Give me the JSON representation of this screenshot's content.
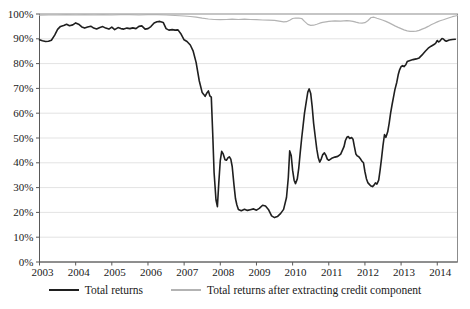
{
  "chart_data": {
    "type": "line",
    "title": "",
    "xlabel": "",
    "ylabel": "",
    "grid": "horizontal",
    "legend_position": "bottom",
    "x_axis": {
      "min": 2003,
      "max": 2014.56,
      "tick_labels": [
        "2003",
        "2004",
        "2005",
        "2006",
        "2007",
        "2008",
        "2009",
        "2010",
        "2011",
        "2012",
        "2013",
        "2014"
      ]
    },
    "y_axis": {
      "min": 0,
      "max": 100,
      "step": 10,
      "unit": "%",
      "tick_labels": [
        "0%",
        "10%",
        "20%",
        "30%",
        "40%",
        "50%",
        "60%",
        "70%",
        "80%",
        "90%",
        "100%"
      ]
    },
    "series": [
      {
        "name": "Total returns",
        "color": "#1f1f1f",
        "stroke_width": 1.6,
        "points": [
          [
            2003.0,
            89.6
          ],
          [
            2003.08,
            89.2
          ],
          [
            2003.17,
            88.9
          ],
          [
            2003.25,
            89.0
          ],
          [
            2003.33,
            89.4
          ],
          [
            2003.42,
            91.5
          ],
          [
            2003.5,
            93.8
          ],
          [
            2003.58,
            95.0
          ],
          [
            2003.67,
            95.4
          ],
          [
            2003.75,
            95.9
          ],
          [
            2003.83,
            95.3
          ],
          [
            2003.92,
            95.6
          ],
          [
            2004.0,
            96.4
          ],
          [
            2004.08,
            95.9
          ],
          [
            2004.17,
            94.8
          ],
          [
            2004.25,
            94.3
          ],
          [
            2004.33,
            94.7
          ],
          [
            2004.42,
            95.1
          ],
          [
            2004.5,
            94.3
          ],
          [
            2004.58,
            94.0
          ],
          [
            2004.67,
            94.6
          ],
          [
            2004.75,
            94.9
          ],
          [
            2004.83,
            94.3
          ],
          [
            2004.92,
            93.9
          ],
          [
            2005.0,
            94.7
          ],
          [
            2005.08,
            93.7
          ],
          [
            2005.17,
            94.5
          ],
          [
            2005.25,
            94.1
          ],
          [
            2005.33,
            93.9
          ],
          [
            2005.42,
            94.3
          ],
          [
            2005.5,
            94.1
          ],
          [
            2005.58,
            94.4
          ],
          [
            2005.67,
            94.1
          ],
          [
            2005.75,
            95.0
          ],
          [
            2005.83,
            95.2
          ],
          [
            2005.92,
            93.9
          ],
          [
            2006.0,
            94.1
          ],
          [
            2006.08,
            94.9
          ],
          [
            2006.17,
            96.4
          ],
          [
            2006.25,
            96.9
          ],
          [
            2006.33,
            97.0
          ],
          [
            2006.42,
            96.6
          ],
          [
            2006.5,
            94.1
          ],
          [
            2006.58,
            93.5
          ],
          [
            2006.67,
            93.7
          ],
          [
            2006.75,
            93.5
          ],
          [
            2006.83,
            93.6
          ],
          [
            2006.92,
            91.8
          ],
          [
            2007.0,
            89.6
          ],
          [
            2007.08,
            88.9
          ],
          [
            2007.17,
            87.5
          ],
          [
            2007.25,
            85.0
          ],
          [
            2007.33,
            80.5
          ],
          [
            2007.42,
            73.0
          ],
          [
            2007.5,
            68.3
          ],
          [
            2007.54,
            67.6
          ],
          [
            2007.58,
            66.8
          ],
          [
            2007.63,
            68.2
          ],
          [
            2007.67,
            69.0
          ],
          [
            2007.71,
            67.0
          ],
          [
            2007.75,
            66.5
          ],
          [
            2007.79,
            52.0
          ],
          [
            2007.83,
            36.0
          ],
          [
            2007.88,
            25.0
          ],
          [
            2007.92,
            22.3
          ],
          [
            2007.96,
            32.0
          ],
          [
            2008.0,
            41.0
          ],
          [
            2008.04,
            44.6
          ],
          [
            2008.08,
            43.6
          ],
          [
            2008.13,
            41.2
          ],
          [
            2008.17,
            41.0
          ],
          [
            2008.21,
            42.0
          ],
          [
            2008.25,
            42.4
          ],
          [
            2008.29,
            41.5
          ],
          [
            2008.33,
            38.5
          ],
          [
            2008.38,
            31.0
          ],
          [
            2008.42,
            25.5
          ],
          [
            2008.46,
            23.0
          ],
          [
            2008.5,
            21.2
          ],
          [
            2008.58,
            20.7
          ],
          [
            2008.67,
            21.3
          ],
          [
            2008.75,
            20.8
          ],
          [
            2008.83,
            21.1
          ],
          [
            2008.92,
            21.4
          ],
          [
            2009.0,
            20.9
          ],
          [
            2009.08,
            21.6
          ],
          [
            2009.17,
            22.9
          ],
          [
            2009.25,
            22.6
          ],
          [
            2009.33,
            21.2
          ],
          [
            2009.42,
            18.6
          ],
          [
            2009.5,
            17.9
          ],
          [
            2009.58,
            18.3
          ],
          [
            2009.67,
            19.6
          ],
          [
            2009.75,
            21.2
          ],
          [
            2009.83,
            26.0
          ],
          [
            2009.88,
            34.0
          ],
          [
            2009.92,
            44.8
          ],
          [
            2009.96,
            43.0
          ],
          [
            2010.0,
            37.0
          ],
          [
            2010.04,
            33.0
          ],
          [
            2010.08,
            31.6
          ],
          [
            2010.13,
            33.5
          ],
          [
            2010.17,
            38.0
          ],
          [
            2010.21,
            44.0
          ],
          [
            2010.25,
            50.0
          ],
          [
            2010.29,
            55.0
          ],
          [
            2010.33,
            60.0
          ],
          [
            2010.38,
            65.0
          ],
          [
            2010.42,
            68.5
          ],
          [
            2010.46,
            69.8
          ],
          [
            2010.5,
            68.0
          ],
          [
            2010.54,
            63.0
          ],
          [
            2010.58,
            56.0
          ],
          [
            2010.63,
            50.0
          ],
          [
            2010.67,
            45.5
          ],
          [
            2010.71,
            42.0
          ],
          [
            2010.75,
            40.3
          ],
          [
            2010.79,
            41.5
          ],
          [
            2010.83,
            43.2
          ],
          [
            2010.88,
            44.0
          ],
          [
            2010.92,
            43.0
          ],
          [
            2010.96,
            41.5
          ],
          [
            2011.0,
            41.0
          ],
          [
            2011.08,
            41.8
          ],
          [
            2011.17,
            42.3
          ],
          [
            2011.25,
            42.6
          ],
          [
            2011.33,
            43.5
          ],
          [
            2011.42,
            46.5
          ],
          [
            2011.46,
            49.0
          ],
          [
            2011.5,
            50.3
          ],
          [
            2011.54,
            50.6
          ],
          [
            2011.58,
            49.8
          ],
          [
            2011.63,
            50.2
          ],
          [
            2011.67,
            49.5
          ],
          [
            2011.71,
            46.5
          ],
          [
            2011.75,
            43.5
          ],
          [
            2011.79,
            42.8
          ],
          [
            2011.83,
            42.4
          ],
          [
            2011.88,
            41.5
          ],
          [
            2011.92,
            40.6
          ],
          [
            2011.96,
            40.0
          ],
          [
            2012.0,
            36.5
          ],
          [
            2012.04,
            33.6
          ],
          [
            2012.08,
            32.0
          ],
          [
            2012.13,
            31.2
          ],
          [
            2012.17,
            30.6
          ],
          [
            2012.21,
            30.4
          ],
          [
            2012.25,
            31.0
          ],
          [
            2012.29,
            31.9
          ],
          [
            2012.33,
            31.4
          ],
          [
            2012.38,
            33.0
          ],
          [
            2012.42,
            37.0
          ],
          [
            2012.46,
            42.0
          ],
          [
            2012.5,
            47.0
          ],
          [
            2012.54,
            51.4
          ],
          [
            2012.58,
            50.3
          ],
          [
            2012.63,
            52.5
          ],
          [
            2012.67,
            56.0
          ],
          [
            2012.71,
            60.0
          ],
          [
            2012.75,
            63.5
          ],
          [
            2012.79,
            66.5
          ],
          [
            2012.83,
            69.5
          ],
          [
            2012.88,
            72.5
          ],
          [
            2012.92,
            75.5
          ],
          [
            2012.96,
            77.5
          ],
          [
            2013.0,
            78.8
          ],
          [
            2013.04,
            79.2
          ],
          [
            2013.08,
            78.8
          ],
          [
            2013.13,
            79.5
          ],
          [
            2013.17,
            80.8
          ],
          [
            2013.25,
            81.3
          ],
          [
            2013.33,
            81.6
          ],
          [
            2013.42,
            81.9
          ],
          [
            2013.5,
            82.3
          ],
          [
            2013.58,
            83.5
          ],
          [
            2013.67,
            85.0
          ],
          [
            2013.75,
            86.2
          ],
          [
            2013.83,
            87.0
          ],
          [
            2013.92,
            87.8
          ],
          [
            2013.96,
            88.3
          ],
          [
            2014.0,
            89.3
          ],
          [
            2014.04,
            88.7
          ],
          [
            2014.08,
            89.2
          ],
          [
            2014.13,
            90.1
          ],
          [
            2014.17,
            89.9
          ],
          [
            2014.21,
            89.3
          ],
          [
            2014.25,
            89.0
          ],
          [
            2014.33,
            89.5
          ],
          [
            2014.42,
            89.7
          ],
          [
            2014.5,
            89.8
          ]
        ]
      },
      {
        "name": "Total returns after extracting credit component",
        "color": "#b3b3b3",
        "stroke_width": 1.2,
        "points": [
          [
            2003.0,
            99.5
          ],
          [
            2003.25,
            99.6
          ],
          [
            2003.5,
            99.6
          ],
          [
            2003.75,
            99.7
          ],
          [
            2004.0,
            99.6
          ],
          [
            2004.25,
            99.7
          ],
          [
            2004.5,
            99.6
          ],
          [
            2004.75,
            99.7
          ],
          [
            2005.0,
            99.6
          ],
          [
            2005.25,
            99.7
          ],
          [
            2005.5,
            99.7
          ],
          [
            2005.75,
            99.6
          ],
          [
            2006.0,
            99.7
          ],
          [
            2006.25,
            99.7
          ],
          [
            2006.5,
            99.6
          ],
          [
            2006.75,
            99.4
          ],
          [
            2007.0,
            99.2
          ],
          [
            2007.17,
            99.0
          ],
          [
            2007.33,
            98.7
          ],
          [
            2007.5,
            98.3
          ],
          [
            2007.67,
            98.0
          ],
          [
            2007.83,
            97.8
          ],
          [
            2008.0,
            97.7
          ],
          [
            2008.17,
            97.8
          ],
          [
            2008.33,
            97.9
          ],
          [
            2008.5,
            97.8
          ],
          [
            2008.67,
            97.9
          ],
          [
            2008.83,
            97.8
          ],
          [
            2009.0,
            97.7
          ],
          [
            2009.17,
            97.6
          ],
          [
            2009.33,
            97.5
          ],
          [
            2009.5,
            97.4
          ],
          [
            2009.67,
            97.0
          ],
          [
            2009.75,
            96.8
          ],
          [
            2009.83,
            96.9
          ],
          [
            2009.92,
            97.5
          ],
          [
            2010.0,
            98.2
          ],
          [
            2010.08,
            98.4
          ],
          [
            2010.17,
            98.3
          ],
          [
            2010.25,
            98.2
          ],
          [
            2010.33,
            97.0
          ],
          [
            2010.42,
            95.8
          ],
          [
            2010.5,
            95.4
          ],
          [
            2010.58,
            95.5
          ],
          [
            2010.67,
            95.9
          ],
          [
            2010.75,
            96.3
          ],
          [
            2010.83,
            96.6
          ],
          [
            2010.92,
            96.8
          ],
          [
            2011.0,
            97.0
          ],
          [
            2011.17,
            97.2
          ],
          [
            2011.33,
            97.1
          ],
          [
            2011.5,
            97.3
          ],
          [
            2011.58,
            97.2
          ],
          [
            2011.67,
            97.0
          ],
          [
            2011.75,
            96.7
          ],
          [
            2011.83,
            96.4
          ],
          [
            2011.92,
            96.3
          ],
          [
            2012.0,
            96.5
          ],
          [
            2012.08,
            97.3
          ],
          [
            2012.17,
            98.6
          ],
          [
            2012.25,
            98.7
          ],
          [
            2012.33,
            98.3
          ],
          [
            2012.42,
            97.9
          ],
          [
            2012.5,
            97.5
          ],
          [
            2012.58,
            97.0
          ],
          [
            2012.67,
            96.4
          ],
          [
            2012.75,
            95.8
          ],
          [
            2012.83,
            95.2
          ],
          [
            2012.92,
            94.6
          ],
          [
            2013.0,
            94.1
          ],
          [
            2013.08,
            93.6
          ],
          [
            2013.17,
            93.2
          ],
          [
            2013.25,
            93.0
          ],
          [
            2013.33,
            93.0
          ],
          [
            2013.42,
            93.1
          ],
          [
            2013.5,
            93.4
          ],
          [
            2013.58,
            93.9
          ],
          [
            2013.67,
            94.4
          ],
          [
            2013.75,
            95.0
          ],
          [
            2013.83,
            95.7
          ],
          [
            2013.92,
            96.3
          ],
          [
            2014.0,
            96.8
          ],
          [
            2014.08,
            97.3
          ],
          [
            2014.17,
            97.7
          ],
          [
            2014.25,
            98.1
          ],
          [
            2014.33,
            98.5
          ],
          [
            2014.42,
            98.9
          ],
          [
            2014.5,
            99.2
          ],
          [
            2014.56,
            99.4
          ]
        ]
      }
    ],
    "colors": {
      "axis": "#595959",
      "frame": "#8c8c8c",
      "gridline": "#e3e3e3",
      "text": "#1a1a1a",
      "background": "#ffffff"
    }
  }
}
